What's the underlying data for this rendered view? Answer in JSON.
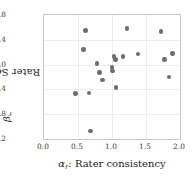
{
  "chart_data": {
    "type": "scatter",
    "title": "",
    "xlabel": "αᵣ: Rater consistency",
    "ylabel": "βᵣ: Rater Severity",
    "xlim": [
      0.0,
      2.0
    ],
    "ylim": [
      -1.2,
      0.8
    ],
    "xticks": [
      "0.0",
      "0.5",
      "1.0",
      "1.5",
      "2.0"
    ],
    "xtick_values": [
      0.0,
      0.5,
      1.0,
      1.5,
      2.0
    ],
    "yticks": [
      "0.8",
      "0.4",
      "0.0",
      "-0.4",
      "-0.8",
      "-1.2"
    ],
    "ytick_values": [
      0.8,
      0.4,
      0.0,
      -0.4,
      -0.8,
      -1.2
    ],
    "grid": true,
    "legend": null,
    "marker_color": "#6e6e6e",
    "points": [
      {
        "x": 0.46,
        "y": -0.47
      },
      {
        "x": 0.58,
        "y": 0.24
      },
      {
        "x": 0.61,
        "y": 0.55
      },
      {
        "x": 0.66,
        "y": -0.46
      },
      {
        "x": 0.68,
        "y": -1.07
      },
      {
        "x": 0.78,
        "y": 0.02
      },
      {
        "x": 0.82,
        "y": -0.13
      },
      {
        "x": 0.86,
        "y": -0.25
      },
      {
        "x": 1.0,
        "y": -0.05
      },
      {
        "x": 1.01,
        "y": -0.1
      },
      {
        "x": 1.03,
        "y": 0.13
      },
      {
        "x": 1.05,
        "y": 0.08
      },
      {
        "x": 1.06,
        "y": -0.37
      },
      {
        "x": 1.16,
        "y": 0.13
      },
      {
        "x": 1.22,
        "y": 0.58
      },
      {
        "x": 1.38,
        "y": 0.17
      },
      {
        "x": 1.72,
        "y": 0.53
      },
      {
        "x": 1.77,
        "y": 0.08
      },
      {
        "x": 1.84,
        "y": -0.2
      },
      {
        "x": 1.89,
        "y": 0.18
      }
    ]
  },
  "axes": {
    "ylabel_symbol": "β",
    "ylabel_sub": "r",
    "ylabel_text": ": Rater Severity",
    "xlabel_symbol": "α",
    "xlabel_sub": "r",
    "xlabel_text": ": Rater consistency"
  }
}
